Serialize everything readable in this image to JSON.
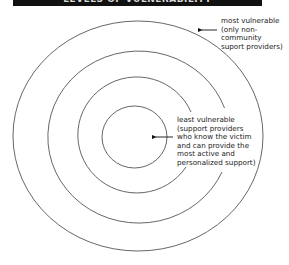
{
  "banner": {
    "title": "LEVELS OF VULNERABILITY",
    "background": "#111111"
  },
  "diagram": {
    "type": "concentric-circles",
    "ring_count": 4,
    "ring_color": "#555555",
    "outer_label": {
      "lines": [
        "most vulnerable",
        "(only non-",
        "community",
        "suport providers)"
      ]
    },
    "inner_label": {
      "lines": [
        "least vulnerable",
        "(support providers",
        "who know the victim",
        "and can provide the",
        "most active and",
        "personalized support)"
      ]
    }
  }
}
